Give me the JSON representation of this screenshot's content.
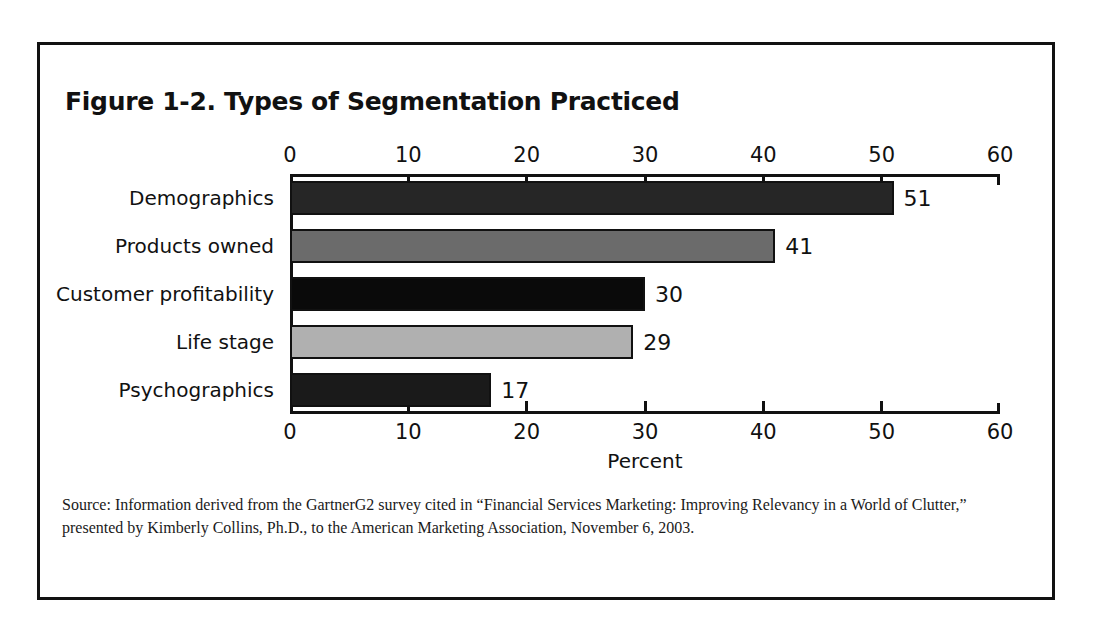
{
  "figure": {
    "title": "Figure 1-2. Types of Segmentation Practiced",
    "source_line1": "Source: Information derived from the GartnerG2 survey cited in “Financial Services Marketing: Improving Relevancy in a World of Clutter,”",
    "source_line2": "presented by Kimberly Collins, Ph.D., to the American Marketing Association, November 6, 2003."
  },
  "chart_data": {
    "type": "bar",
    "orientation": "horizontal",
    "title": "Figure 1-2. Types of Segmentation Practiced",
    "categories": [
      "Demographics",
      "Products owned",
      "Customer profitability",
      "Life stage",
      "Psychographics"
    ],
    "values": [
      51,
      41,
      30,
      29,
      17
    ],
    "value_labels": [
      "51",
      "41",
      "30",
      "29",
      "17"
    ],
    "bar_colors": [
      "#262626",
      "#6b6b6b",
      "#0a0a0a",
      "#b0b0b0",
      "#1a1a1a"
    ],
    "bar_border_color": "#111111",
    "xlabel": "Percent",
    "ylabel": "",
    "xlim": [
      0,
      60
    ],
    "xticks": [
      0,
      10,
      20,
      30,
      40,
      50,
      60
    ],
    "xtick_labels": [
      "0",
      "10",
      "20",
      "30",
      "40",
      "50",
      "60"
    ],
    "axis_top": true,
    "axis_bottom": true,
    "grid": false,
    "legend": false
  }
}
